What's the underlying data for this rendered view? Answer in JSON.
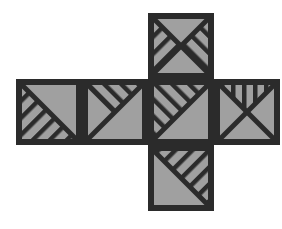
{
  "figure": {
    "type": "geometric-net",
    "shape": "cross",
    "face_count": 6,
    "colors": {
      "background": "#ffffff",
      "fill": "#a0a0a0",
      "stroke": "#2b2b2b"
    },
    "geometry": {
      "cell_size": 66,
      "border_width": 6,
      "hatch_width": 4,
      "col_x": [
        16,
        82,
        148,
        214
      ],
      "row_y": [
        13,
        79,
        145,
        211
      ]
    },
    "faces": [
      {
        "id": "face-top",
        "position": "top",
        "col": 2,
        "row": 1,
        "grid_x": 148,
        "grid_y": 13,
        "divider": "x-cross",
        "hatched_regions": [
          "left-triangle",
          "right-triangle"
        ],
        "hatch_directions": [
          "backslash",
          "slash"
        ],
        "description": "Square split by both diagonals into four triangles; the left triangle is hatched with backslash lines and the right triangle with slash lines."
      },
      {
        "id": "face-left",
        "position": "middle-left",
        "col": 1,
        "row": 2,
        "grid_x": 16,
        "grid_y": 79,
        "divider": "backslash-diagonal",
        "hatched_regions": [
          "lower-left-triangle"
        ],
        "hatch_directions": [
          "backslash"
        ],
        "description": "Square split by a backslash diagonal; lower-left triangle filled with backslash hatching."
      },
      {
        "id": "face-second",
        "position": "middle-second",
        "col": 2,
        "row": 2,
        "grid_x": 82,
        "grid_y": 79,
        "divider": "slash-diagonal",
        "hatched_regions": [
          "upper-inner-triangle"
        ],
        "hatch_directions": [
          "slash"
        ],
        "description": "Square split by a slash diagonal; a smaller inner triangle at the top is hatched with slash lines forming a chevron."
      },
      {
        "id": "face-center",
        "position": "middle-center",
        "col": 3,
        "row": 2,
        "grid_x": 148,
        "grid_y": 79,
        "divider": "slash-diagonal",
        "hatched_regions": [
          "upper-left-triangle"
        ],
        "hatch_directions": [
          "slash"
        ],
        "description": "Square split by a slash diagonal; upper-left triangle fully hatched with slash lines."
      },
      {
        "id": "face-right",
        "position": "middle-right",
        "col": 4,
        "row": 2,
        "grid_x": 214,
        "grid_y": 79,
        "divider": "x-cross",
        "hatched_regions": [
          "top-triangle"
        ],
        "hatch_directions": [
          "vertical"
        ],
        "description": "Square split by both diagonals into four triangles; the top triangle is filled with vertical lines."
      },
      {
        "id": "face-bottom",
        "position": "bottom",
        "col": 2,
        "row": 3,
        "grid_x": 148,
        "grid_y": 145,
        "divider": "backslash-diagonal",
        "hatched_regions": [
          "upper-right-triangle"
        ],
        "hatch_directions": [
          "backslash"
        ],
        "description": "Square split by a backslash diagonal; upper-right triangle filled with backslash hatching."
      }
    ]
  }
}
